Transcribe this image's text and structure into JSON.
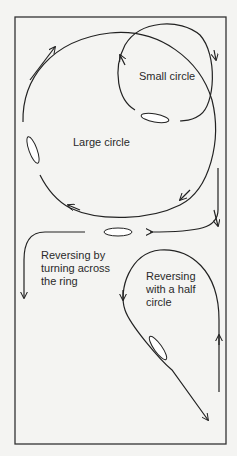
{
  "labels": {
    "small_circle": "Small circle",
    "large_circle": "Large circle",
    "reverse_across_1": "Reversing by",
    "reverse_across_2": "turning across",
    "reverse_across_3": "the ring",
    "reverse_half_1": "Reversing",
    "reverse_half_2": "with a half",
    "reverse_half_3": "circle"
  },
  "colors": {
    "ink": "#222222",
    "paper": "#f4f4f2"
  }
}
